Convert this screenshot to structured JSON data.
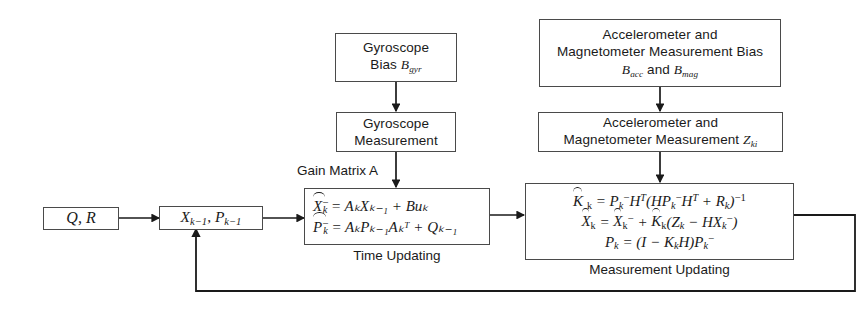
{
  "diagram": {
    "type": "flow-block-diagram",
    "stroke_color": "#4a4a4a",
    "background_color": "#ffffff"
  },
  "boxes": {
    "gyro_bias": {
      "line1": "Gyroscope",
      "line2_prefix": "Bias ",
      "line2_sym": "B",
      "line2_sub": "gyr"
    },
    "acc_mag_bias": {
      "line1": "Accelerometer and",
      "line2": "Magnetometer Measurement Bias",
      "line3_sym1": "B",
      "line3_sub1": "acc",
      "line3_mid": " and ",
      "line3_sym2": "B",
      "line3_sub2": "mag"
    },
    "gyro_meas": {
      "line1": "Gyroscope",
      "line2": "Measurement"
    },
    "acc_mag_meas": {
      "line1": "Accelerometer and",
      "line2_prefix": "Magnetometer Measurement ",
      "line2_sym": "Z",
      "line2_sub": "ki"
    },
    "qr": {
      "text": "Q, R"
    },
    "state_prev": {
      "sym1": "X",
      "sub1": "k−1",
      "sep": ", ",
      "sym2": "P",
      "sub2": "k−1"
    },
    "time_update": {
      "eq1": {
        "lhs_sym": "X",
        "lhs_sub": "k",
        "lhs_sup": "−",
        "rhs": "= AₖXₖ₋₁ + Buₖ"
      },
      "eq2": {
        "lhs_sym": "P",
        "lhs_sub": "k",
        "lhs_sup": "−",
        "rhs": "= AₖPₖ₋₁Aₖᵀ + Qₖ₋₁"
      },
      "caption": "Time Updating"
    },
    "meas_update": {
      "eq1": "Kₖ = Pₖ⁻Hᵀ(HPₖ⁻Hᵀ + Rₖ)⁻¹",
      "eq2": "Xₖ = Xₖ⁻ + Kₖ(Zₖ − HXₖ⁻)",
      "eq3": "Pₖ = (I − KₖH)Pₖ⁻",
      "caption": "Measurement Updating"
    }
  },
  "labels": {
    "gain_matrix": "Gain Matrix A"
  },
  "connections": [
    {
      "name": "gyro-bias-to-gyro-meas",
      "from": "gyro_bias",
      "to": "gyro_meas",
      "direction": "down"
    },
    {
      "name": "acc-mag-bias-to-acc-mag-meas",
      "from": "acc_mag_bias",
      "to": "acc_mag_meas",
      "direction": "down"
    },
    {
      "name": "gyro-meas-to-time-update",
      "from": "gyro_meas",
      "to": "time_update",
      "direction": "down"
    },
    {
      "name": "acc-mag-meas-to-meas-update",
      "from": "acc_mag_meas",
      "to": "meas_update",
      "direction": "down"
    },
    {
      "name": "qr-to-state-prev",
      "from": "qr",
      "to": "state_prev",
      "direction": "right"
    },
    {
      "name": "state-prev-to-time-update",
      "from": "state_prev",
      "to": "time_update",
      "direction": "right"
    },
    {
      "name": "time-update-to-meas-update",
      "from": "time_update",
      "to": "meas_update",
      "direction": "right"
    },
    {
      "name": "meas-update-feedback-to-state-prev",
      "from": "meas_update",
      "to": "state_prev",
      "direction": "feedback-loop"
    }
  ]
}
